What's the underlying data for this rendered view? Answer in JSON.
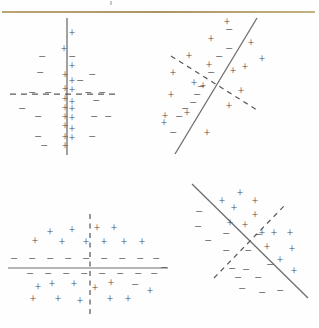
{
  "figure": {
    "background_color": "#fefefe",
    "rule_color": "#b8a06a",
    "marker_color": "#4b4b4b",
    "solid_line_color": "#6e6e6e",
    "dashed_line_color": "#5a5a5a",
    "positive_symbol": "+",
    "negative_symbol": "−",
    "panel_count": 4
  },
  "chart_data": [
    {
      "id": "top-left",
      "type": "scatter",
      "title": "",
      "xlabel": "",
      "ylabel": "",
      "xlim": [
        0,
        160
      ],
      "ylim": [
        0,
        166
      ],
      "grid": false,
      "legend": null,
      "boundaries": [
        {
          "name": "vertical-solid-boundary",
          "style": "solid",
          "orientation": "vertical",
          "x1": 67,
          "y1": 4,
          "x2": 67,
          "y2": 141
        },
        {
          "name": "horizontal-dashed-boundary",
          "style": "dashed",
          "orientation": "horizontal",
          "x1": 10,
          "y1": 80,
          "x2": 118,
          "y2": 80
        }
      ],
      "series": [
        {
          "name": "positive",
          "symbol": "+",
          "points": [
            [
              72,
              20
            ],
            [
              64,
              36
            ],
            [
              72,
              53
            ],
            [
              65,
              62
            ],
            [
              72,
              68
            ],
            [
              65,
              76
            ],
            [
              72,
              77
            ],
            [
              65,
              86
            ],
            [
              72,
              89
            ],
            [
              65,
              95
            ],
            [
              72,
              96
            ],
            [
              65,
              104
            ],
            [
              72,
              105
            ],
            [
              65,
              113
            ],
            [
              72,
              116
            ],
            [
              65,
              124
            ],
            [
              72,
              125
            ],
            [
              65,
              133
            ]
          ]
        },
        {
          "name": "negative",
          "symbol": "−",
          "points": [
            [
              42,
              44
            ],
            [
              72,
              44
            ],
            [
              40,
              60
            ],
            [
              80,
              68
            ],
            [
              92,
              62
            ],
            [
              32,
              80
            ],
            [
              48,
              80
            ],
            [
              88,
              80
            ],
            [
              102,
              80
            ],
            [
              96,
              88
            ],
            [
              22,
              96
            ],
            [
              38,
              104
            ],
            [
              94,
              104
            ],
            [
              108,
              104
            ],
            [
              38,
              124
            ],
            [
              44,
              133
            ],
            [
              92,
              124
            ]
          ]
        }
      ]
    },
    {
      "id": "top-right",
      "type": "scatter",
      "title": "",
      "xlabel": "",
      "ylabel": "",
      "xlim": [
        0,
        160
      ],
      "ylim": [
        0,
        166
      ],
      "grid": false,
      "legend": null,
      "boundaries": [
        {
          "name": "rising-solid-boundary",
          "style": "solid",
          "orientation": "diagonal-rising",
          "x1": 16,
          "y1": 140,
          "x2": 98,
          "y2": 4
        },
        {
          "name": "falling-dashed-boundary",
          "style": "dashed",
          "orientation": "diagonal-falling",
          "x1": 12,
          "y1": 42,
          "x2": 98,
          "y2": 96
        }
      ],
      "series": [
        {
          "name": "positive",
          "symbol": "+",
          "points": [
            [
              68,
              9
            ],
            [
              52,
              26
            ],
            [
              92,
              30
            ],
            [
              30,
              43
            ],
            [
              50,
              52
            ],
            [
              103,
              46
            ],
            [
              86,
              54
            ],
            [
              35,
              70
            ],
            [
              74,
              58
            ],
            [
              14,
              60
            ],
            [
              12,
              82
            ],
            [
              82,
              78
            ],
            [
              6,
              103
            ],
            [
              28,
              100
            ],
            [
              70,
              93
            ],
            [
              48,
              120
            ],
            [
              5,
              110
            ],
            [
              44,
              73
            ]
          ]
        },
        {
          "name": "negative",
          "symbol": "−",
          "points": [
            [
              70,
              17
            ],
            [
              70,
              36
            ],
            [
              60,
              44
            ],
            [
              52,
              60
            ],
            [
              42,
              74
            ],
            [
              38,
              82
            ],
            [
              26,
              96
            ],
            [
              20,
              104
            ],
            [
              14,
              120
            ],
            [
              34,
              90
            ]
          ]
        }
      ]
    },
    {
      "id": "bottom-left",
      "type": "scatter",
      "title": "",
      "xlabel": "",
      "ylabel": "",
      "xlim": [
        0,
        170
      ],
      "ylim": [
        0,
        148
      ],
      "grid": false,
      "legend": null,
      "boundaries": [
        {
          "name": "horizontal-solid-boundary",
          "style": "solid",
          "orientation": "horizontal",
          "x1": 8,
          "y1": 88,
          "x2": 168,
          "y2": 88
        },
        {
          "name": "vertical-dashed-boundary",
          "style": "dashed",
          "orientation": "vertical",
          "x1": 90,
          "y1": 34,
          "x2": 90,
          "y2": 136
        }
      ],
      "series": [
        {
          "name": "positive",
          "symbol": "+",
          "points": [
            [
              50,
              53
            ],
            [
              72,
              51
            ],
            [
              97,
              49
            ],
            [
              114,
              49
            ],
            [
              35,
              62
            ],
            [
              62,
              63
            ],
            [
              86,
              63
            ],
            [
              104,
              63
            ],
            [
              124,
              63
            ],
            [
              142,
              63
            ],
            [
              38,
              108
            ],
            [
              52,
              105
            ],
            [
              74,
              105
            ],
            [
              95,
              109
            ],
            [
              111,
              104
            ],
            [
              33,
              120
            ],
            [
              58,
              120
            ],
            [
              80,
              122
            ],
            [
              110,
              120
            ],
            [
              128,
              120
            ],
            [
              150,
              112
            ]
          ]
        },
        {
          "name": "negative",
          "symbol": "−",
          "points": [
            [
              14,
              80
            ],
            [
              32,
              80
            ],
            [
              50,
              80
            ],
            [
              68,
              80
            ],
            [
              86,
              80
            ],
            [
              104,
              80
            ],
            [
              122,
              80
            ],
            [
              140,
              80
            ],
            [
              156,
              80
            ],
            [
              30,
              95
            ],
            [
              48,
              95
            ],
            [
              66,
              95
            ],
            [
              84,
              95
            ],
            [
              102,
              95
            ],
            [
              120,
              95
            ],
            [
              138,
              95
            ],
            [
              154,
              95
            ],
            [
              135,
              106
            ]
          ]
        }
      ]
    },
    {
      "id": "bottom-right",
      "type": "scatter",
      "title": "",
      "xlabel": "",
      "ylabel": "",
      "xlim": [
        0,
        157
      ],
      "ylim": [
        0,
        148
      ],
      "grid": false,
      "legend": null,
      "boundaries": [
        {
          "name": "falling-solid-boundary",
          "style": "solid",
          "orientation": "diagonal-falling",
          "x1": 30,
          "y1": 4,
          "x2": 146,
          "y2": 118
        },
        {
          "name": "rising-dashed-boundary",
          "style": "dashed",
          "orientation": "diagonal-rising",
          "x1": 52,
          "y1": 98,
          "x2": 124,
          "y2": 24
        }
      ],
      "series": [
        {
          "name": "positive",
          "symbol": "+",
          "points": [
            [
              78,
              14
            ],
            [
              60,
              22
            ],
            [
              93,
              22
            ],
            [
              72,
              29
            ],
            [
              93,
              36
            ],
            [
              83,
              46
            ],
            [
              68,
              44
            ],
            [
              100,
              54
            ],
            [
              112,
              54
            ],
            [
              128,
              54
            ],
            [
              105,
              68
            ],
            [
              130,
              70
            ],
            [
              118,
              81
            ],
            [
              132,
              92
            ]
          ]
        },
        {
          "name": "negative",
          "symbol": "−",
          "points": [
            [
              37,
              33
            ],
            [
              36,
              48
            ],
            [
              46,
              62
            ],
            [
              64,
              55
            ],
            [
              96,
              56
            ],
            [
              64,
              72
            ],
            [
              86,
              72
            ],
            [
              2,
              89
            ],
            [
              70,
              90
            ],
            [
              84,
              91
            ],
            [
              76,
              99
            ],
            [
              96,
              99
            ],
            [
              108,
              86
            ],
            [
              80,
              110
            ],
            [
              100,
              114
            ],
            [
              118,
              112
            ]
          ]
        }
      ]
    }
  ]
}
